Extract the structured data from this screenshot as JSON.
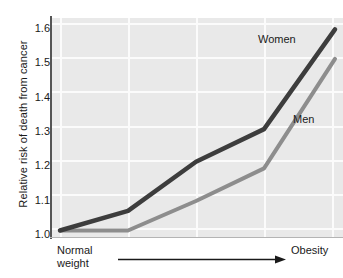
{
  "chart_data": {
    "type": "line",
    "title": "",
    "subtitle": "",
    "xlabel": "",
    "ylabel": "Relative risk of death from cancer",
    "x_axis_start_label": "Normal weight",
    "x_axis_end_label": "Obesity",
    "x_axis_note": "Body-weight gradient shown as an arrow from normal weight to obesity; no numeric x ticks",
    "x": [
      0,
      1,
      2,
      3,
      4
    ],
    "ylim": [
      0.98,
      1.65
    ],
    "yticks": [
      "1.6",
      "1.5",
      "1.4",
      "1.3",
      "1.2",
      "1.1",
      "1.0"
    ],
    "ytick_values": [
      1.6,
      1.5,
      1.4,
      1.3,
      1.2,
      1.1,
      1.0
    ],
    "grid": "white gridlines on light gray plot background",
    "legend": "inline series labels at end of each line",
    "series": [
      {
        "name": "Women",
        "color": "#3d3d3d",
        "values": [
          1.0,
          1.06,
          1.21,
          1.31,
          1.615
        ]
      },
      {
        "name": "Men",
        "color": "#8d8d8d",
        "values": [
          1.0,
          1.0,
          1.09,
          1.19,
          1.525
        ]
      }
    ]
  },
  "labels": {
    "women": "Women",
    "men": "Men",
    "normal_weight_line1": "Normal",
    "normal_weight_line2": "weight",
    "obesity": "Obesity"
  },
  "colors": {
    "women_line": "#3d3d3d",
    "men_line": "#8d8d8d",
    "plot_background": "#e9e9e9",
    "gridline": "#fbfbfb",
    "axis": "#555555",
    "text": "#1a1a1a"
  }
}
